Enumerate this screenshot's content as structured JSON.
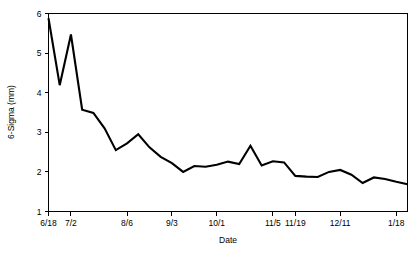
{
  "chart_data": {
    "type": "line",
    "title": "",
    "xlabel": "Date",
    "ylabel": "6-Sigma (mm)",
    "ylim": [
      1,
      6
    ],
    "yticks": [
      1,
      2,
      3,
      4,
      5,
      6
    ],
    "ytick_labels": [
      "1",
      "2",
      "3",
      "4",
      "5",
      "6"
    ],
    "grid": false,
    "legend": false,
    "line_color": "#000000",
    "background_color": "#ffffff",
    "xtick_labels": [
      "6/18",
      "7/2",
      "8/6",
      "9/3",
      "10/1",
      "11/5",
      "11/19",
      "12/11",
      "1/18"
    ],
    "xtick_indices": [
      0,
      2,
      7,
      11,
      15,
      20,
      22,
      26,
      31
    ],
    "x": [
      "6/18",
      "6/25",
      "7/2",
      "7/9",
      "7/16",
      "7/23",
      "7/30",
      "8/6",
      "8/13",
      "8/20",
      "8/27",
      "9/3",
      "9/10",
      "9/17",
      "9/24",
      "10/1",
      "10/8",
      "10/15",
      "10/22",
      "10/29",
      "11/5",
      "11/12",
      "11/19",
      "11/26",
      "12/3",
      "12/10",
      "12/11",
      "12/18",
      "12/25",
      "1/4",
      "1/11",
      "1/18",
      "1/25"
    ],
    "values": [
      5.88,
      4.19,
      5.47,
      3.57,
      3.49,
      3.1,
      2.55,
      2.72,
      2.95,
      2.62,
      2.38,
      2.22,
      2.0,
      2.15,
      2.13,
      2.18,
      2.26,
      2.2,
      2.66,
      2.16,
      2.27,
      2.24,
      1.9,
      1.88,
      1.87,
      2.0,
      2.05,
      1.93,
      1.72,
      1.86,
      1.82,
      1.75,
      1.69
    ]
  },
  "axis": {
    "ylabel": "6-Sigma (mm)",
    "xlabel": "Date"
  }
}
